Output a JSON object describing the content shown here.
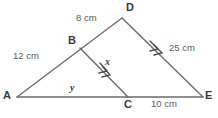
{
  "diagram": {
    "type": "geometry-figure",
    "background_color": "#ffffff",
    "line_color": "#6b6b6b",
    "label_color": "#3b3b3b",
    "measure_color": "#5a5a5a",
    "vertices": [
      {
        "name": "A",
        "label": "A",
        "x": 17,
        "y": 97
      },
      {
        "name": "B",
        "label": "B",
        "x": 80,
        "y": 48
      },
      {
        "name": "C",
        "label": "C",
        "x": 128,
        "y": 97
      },
      {
        "name": "D",
        "label": "D",
        "x": 122,
        "y": 18
      },
      {
        "name": "E",
        "label": "E",
        "x": 203,
        "y": 97
      }
    ],
    "vertex_label_positions": [
      {
        "name": "A",
        "left": 3,
        "top": 91
      },
      {
        "name": "B",
        "left": 68,
        "top": 36
      },
      {
        "name": "C",
        "left": 124,
        "top": 100
      },
      {
        "name": "D",
        "left": 126,
        "top": 3
      },
      {
        "name": "E",
        "left": 206,
        "top": 91
      }
    ],
    "segments": [
      {
        "name": "AD",
        "from": "A",
        "to": "D"
      },
      {
        "name": "AE",
        "from": "A",
        "to": "E"
      },
      {
        "name": "DE",
        "from": "D",
        "to": "E"
      },
      {
        "name": "BC",
        "from": "B",
        "to": "C"
      }
    ],
    "measures": [
      {
        "name": "bd-length",
        "text": "8 cm",
        "left": 76,
        "top": 14,
        "segment": "BD"
      },
      {
        "name": "ab-length",
        "text": "12 cm",
        "left": 14,
        "top": 52,
        "segment": "AB"
      },
      {
        "name": "de-length",
        "text": "25 cm",
        "left": 170,
        "top": 43,
        "segment": "DE"
      },
      {
        "name": "ce-length",
        "text": "10 cm",
        "left": 152,
        "top": 100,
        "segment": "CE"
      }
    ],
    "variables": [
      {
        "name": "bc-variable",
        "text": "x",
        "left": 104,
        "top": 58,
        "segment": "BC"
      },
      {
        "name": "ac-variable",
        "text": "y",
        "left": 70,
        "top": 84,
        "segment": "AC"
      }
    ],
    "parallel_marks": [
      {
        "name": "bc-parallel-mark",
        "segment": "BC",
        "count": 2
      },
      {
        "name": "de-parallel-mark",
        "segment": "DE",
        "count": 2
      }
    ]
  }
}
